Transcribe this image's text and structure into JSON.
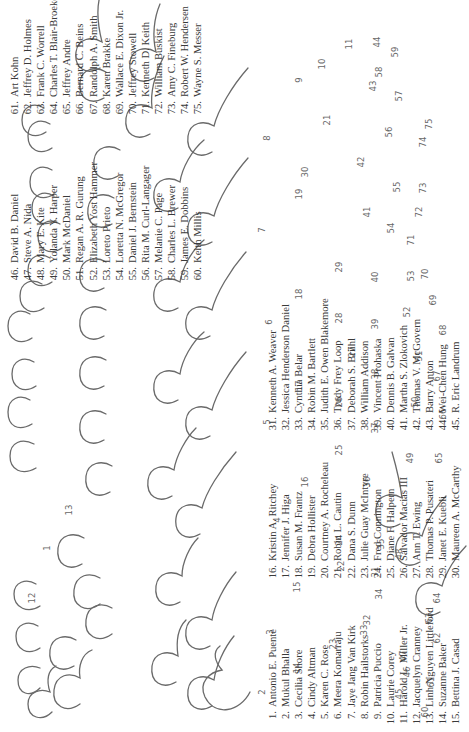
{
  "figure": {
    "silhouette_labels": [
      {
        "n": "1",
        "x": 184,
        "y": 420
      },
      {
        "n": "2",
        "x": 40,
        "y": 205
      },
      {
        "n": "3",
        "x": 100,
        "y": 197
      },
      {
        "n": "4",
        "x": 212,
        "y": 190
      },
      {
        "n": "5",
        "x": 310,
        "y": 200
      },
      {
        "n": "6",
        "x": 410,
        "y": 198
      },
      {
        "n": "7",
        "x": 502,
        "y": 205
      },
      {
        "n": "8",
        "x": 594,
        "y": 200
      },
      {
        "n": "9",
        "x": 652,
        "y": 168
      },
      {
        "n": "11",
        "x": 688,
        "y": 118
      },
      {
        "n": "12",
        "x": 134,
        "y": 435
      },
      {
        "n": "13",
        "x": 222,
        "y": 398
      },
      {
        "n": "14",
        "x": 64,
        "y": 170
      },
      {
        "n": "15",
        "x": 145,
        "y": 170
      },
      {
        "n": "16",
        "x": 250,
        "y": 162
      },
      {
        "n": "17",
        "x": 346,
        "y": 168
      },
      {
        "n": "18",
        "x": 438,
        "y": 168
      },
      {
        "n": "19",
        "x": 538,
        "y": 168
      },
      {
        "n": "10",
        "x": 668,
        "y": 145
      },
      {
        "n": "21",
        "x": 612,
        "y": 140
      },
      {
        "n": "22",
        "x": 166,
        "y": 126
      },
      {
        "n": "23",
        "x": 88,
        "y": 134
      },
      {
        "n": "24",
        "x": 192,
        "y": 128
      },
      {
        "n": "25",
        "x": 282,
        "y": 128
      },
      {
        "n": "26",
        "x": 330,
        "y": 128
      },
      {
        "n": "27",
        "x": 380,
        "y": 115
      },
      {
        "n": "28",
        "x": 414,
        "y": 128
      },
      {
        "n": "29",
        "x": 465,
        "y": 128
      },
      {
        "n": "30",
        "x": 560,
        "y": 162
      },
      {
        "n": "31",
        "x": 160,
        "y": 92
      },
      {
        "n": "32",
        "x": 112,
        "y": 100
      },
      {
        "n": "33",
        "x": 102,
        "y": 103
      },
      {
        "n": "34",
        "x": 138,
        "y": 88
      },
      {
        "n": "35",
        "x": 188,
        "y": 86
      },
      {
        "n": "36",
        "x": 250,
        "y": 100
      },
      {
        "n": "37",
        "x": 304,
        "y": 92
      },
      {
        "n": "38",
        "x": 358,
        "y": 92
      },
      {
        "n": "39",
        "x": 408,
        "y": 92
      },
      {
        "n": "40",
        "x": 455,
        "y": 92
      },
      {
        "n": "41",
        "x": 520,
        "y": 100
      },
      {
        "n": "42",
        "x": 570,
        "y": 106
      },
      {
        "n": "43",
        "x": 646,
        "y": 94
      },
      {
        "n": "44",
        "x": 690,
        "y": 90
      },
      {
        "n": "45",
        "x": 38,
        "y": 68
      },
      {
        "n": "46",
        "x": 60,
        "y": 60
      },
      {
        "n": "47",
        "x": 76,
        "y": 64
      },
      {
        "n": "48",
        "x": 178,
        "y": 68
      },
      {
        "n": "49",
        "x": 274,
        "y": 57
      },
      {
        "n": "50",
        "x": 330,
        "y": 52
      },
      {
        "n": "51",
        "x": 376,
        "y": 48
      },
      {
        "n": "52",
        "x": 420,
        "y": 60
      },
      {
        "n": "53",
        "x": 456,
        "y": 56
      },
      {
        "n": "54",
        "x": 504,
        "y": 76
      },
      {
        "n": "55",
        "x": 545,
        "y": 70
      },
      {
        "n": "56",
        "x": 600,
        "y": 78
      },
      {
        "n": "57",
        "x": 636,
        "y": 68
      },
      {
        "n": "58",
        "x": 660,
        "y": 88
      },
      {
        "n": "59",
        "x": 680,
        "y": 72
      },
      {
        "n": "60",
        "x": 20,
        "y": 42
      },
      {
        "n": "61",
        "x": 50,
        "y": 36
      },
      {
        "n": "62",
        "x": 94,
        "y": 30
      },
      {
        "n": "63",
        "x": 114,
        "y": 38
      },
      {
        "n": "64",
        "x": 134,
        "y": 30
      },
      {
        "n": "65",
        "x": 274,
        "y": 28
      },
      {
        "n": "66",
        "x": 318,
        "y": 24
      },
      {
        "n": "67",
        "x": 356,
        "y": 30
      },
      {
        "n": "68",
        "x": 402,
        "y": 24
      },
      {
        "n": "69",
        "x": 432,
        "y": 34
      },
      {
        "n": "70",
        "x": 458,
        "y": 42
      },
      {
        "n": "71",
        "x": 492,
        "y": 56
      },
      {
        "n": "72",
        "x": 520,
        "y": 48
      },
      {
        "n": "73",
        "x": 544,
        "y": 44
      },
      {
        "n": "74",
        "x": 590,
        "y": 44
      },
      {
        "n": "75",
        "x": 608,
        "y": 38
      }
    ]
  },
  "columns": [
    [
      {
        "num": "1.",
        "name": "Antonio E. Puente"
      },
      {
        "num": "2.",
        "name": "Mukul Bhalla"
      },
      {
        "num": "3.",
        "name": "Cecilia Shore"
      },
      {
        "num": "4.",
        "name": "Cindy Altman"
      },
      {
        "num": "5.",
        "name": "Karen C. Rose"
      },
      {
        "num": "6.",
        "name": "Meera Komarraju"
      },
      {
        "num": "7.",
        "name": "Jaye Jang Van Kirk"
      },
      {
        "num": "8.",
        "name": "Robin Hailstorks"
      },
      {
        "num": "9.",
        "name": "Patricia Puccio"
      },
      {
        "num": "10.",
        "name": "Laurie Corey"
      },
      {
        "num": "11.",
        "name": "Harold L. Miller Jr."
      },
      {
        "num": "12.",
        "name": "Jacquelyn Cranney"
      },
      {
        "num": "13.",
        "name": "Linh Nguyen Littleford"
      },
      {
        "num": "14.",
        "name": "Suzanne Baker"
      },
      {
        "num": "15.",
        "name": "Bettina J. Casad"
      }
    ],
    [
      {
        "num": "16.",
        "name": "Kristin A. Ritchey"
      },
      {
        "num": "17.",
        "name": "Jennifer J. Higa"
      },
      {
        "num": "18.",
        "name": "Susan M. Frantz"
      },
      {
        "num": "19.",
        "name": "Debra Hollister"
      },
      {
        "num": "20.",
        "name": "Courtney A. Rocheleau"
      },
      {
        "num": "21.",
        "name": "Robin L. Cautin"
      },
      {
        "num": "22.",
        "name": "Dana S. Dunn"
      },
      {
        "num": "23.",
        "name": "Julie Guay McIntyre"
      },
      {
        "num": "24.",
        "name": "Fred Connington"
      },
      {
        "num": "25.",
        "name": "Diane F. Halpern"
      },
      {
        "num": "26.",
        "name": "Salvador Macias III"
      },
      {
        "num": "27.",
        "name": "Ann T. Ewing"
      },
      {
        "num": "28.",
        "name": "Thomas P. Pusateri"
      },
      {
        "num": "29.",
        "name": "Janet E. Kuebli"
      },
      {
        "num": "30.",
        "name": "Maureen A. McCarthy"
      }
    ],
    [
      {
        "num": "31.",
        "name": "Kenneth A. Weaver"
      },
      {
        "num": "32.",
        "name": "Jessica Henderson Daniel"
      },
      {
        "num": "33.",
        "name": "Cynthia Belar"
      },
      {
        "num": "34.",
        "name": "Robin M. Bartlett"
      },
      {
        "num": "35.",
        "name": "Judith E. Owen Blakemore"
      },
      {
        "num": "36.",
        "name": "Trudy Frey Loop"
      },
      {
        "num": "37.",
        "name": "Deborah S. Briihl"
      },
      {
        "num": "38.",
        "name": "William Addison"
      },
      {
        "num": "39.",
        "name": "Vincent Prohaska"
      },
      {
        "num": "40.",
        "name": "Dennis B. Galvan"
      },
      {
        "num": "41.",
        "name": "Martha S. Zlokovich"
      },
      {
        "num": "42.",
        "name": "Thomas V. McGovern"
      },
      {
        "num": "43.",
        "name": "Barry Anton"
      },
      {
        "num": "44.",
        "name": "Wei-Chen Hung"
      },
      {
        "num": "45.",
        "name": "R. Eric Landrum"
      }
    ],
    [
      {
        "num": "46.",
        "name": "David B. Daniel"
      },
      {
        "num": "47.",
        "name": "Steve A. Nida"
      },
      {
        "num": "48.",
        "name": "Mary E. Kite"
      },
      {
        "num": "49.",
        "name": "Yolanda Y. Harper"
      },
      {
        "num": "50.",
        "name": "Mark McDaniel"
      },
      {
        "num": "51.",
        "name": "Regan A. R. Gurung"
      },
      {
        "num": "52.",
        "name": "Elizabeth Yost Hammer"
      },
      {
        "num": "53.",
        "name": "Loreto Prieto"
      },
      {
        "num": "54.",
        "name": "Loretta N. McGregor"
      },
      {
        "num": "55.",
        "name": "Daniel J. Bernstein"
      },
      {
        "num": "56.",
        "name": "Rita M. Curl-Langager"
      },
      {
        "num": "57.",
        "name": "Melanie C. Page"
      },
      {
        "num": "58.",
        "name": "Charles L. Brewer"
      },
      {
        "num": "59.",
        "name": "James E. Dobbins"
      },
      {
        "num": "60.",
        "name": "Keith Millis"
      }
    ],
    [
      {
        "num": "61.",
        "name": "Art Kohn"
      },
      {
        "num": "62.",
        "name": "Jeffrey D. Holmes"
      },
      {
        "num": "63.",
        "name": "Frank C. Worrell"
      },
      {
        "num": "64.",
        "name": "Charles T. Blair-Broeker"
      },
      {
        "num": "65.",
        "name": "Jeffrey Andre"
      },
      {
        "num": "66.",
        "name": "Bernard C. Beins"
      },
      {
        "num": "67.",
        "name": "Randolph A. Smith"
      },
      {
        "num": "68.",
        "name": "Karen Brakke"
      },
      {
        "num": "69.",
        "name": "Wallace E. Dixon Jr."
      },
      {
        "num": "70.",
        "name": "Jeffrey Stowell"
      },
      {
        "num": "71.",
        "name": "Kenneth D. Keith"
      },
      {
        "num": "72.",
        "name": "William Buskist"
      },
      {
        "num": "73.",
        "name": "Amy C. Fineburg"
      },
      {
        "num": "74.",
        "name": "Robert W. Hendersen"
      },
      {
        "num": "75.",
        "name": "Wayne S. Messer"
      }
    ]
  ]
}
